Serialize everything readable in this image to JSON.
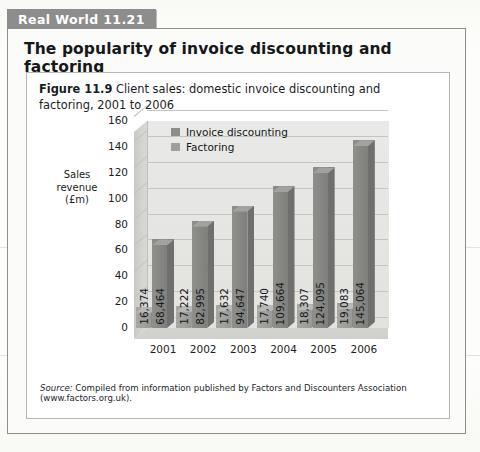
{
  "tab": {
    "label": "Real World 11.21"
  },
  "box": {
    "title": "The popularity of invoice discounting and factoring"
  },
  "figure": {
    "number": "Figure 11.9",
    "caption": "Client sales: domestic invoice discounting and factoring, 2001 to 2006",
    "source_label": "Source:",
    "source_text": "Compiled from information published by Factors and Discounters Association (www.factors.org.uk)."
  },
  "chart_data": {
    "type": "bar",
    "title": "Client sales: domestic invoice discounting and factoring, 2001 to 2006",
    "xlabel": "",
    "ylabel": "Sales revenue (£m)",
    "ylabel_lines": [
      "Sales",
      "revenue",
      "(£m)"
    ],
    "categories": [
      "2001",
      "2002",
      "2003",
      "2004",
      "2005",
      "2006"
    ],
    "ylim": [
      0,
      160
    ],
    "yticks": [
      0,
      20,
      40,
      60,
      80,
      100,
      120,
      140,
      160
    ],
    "grid": true,
    "legend_position": "top-center",
    "series": [
      {
        "name": "Factoring",
        "values": [
          16374,
          17222,
          17632,
          17740,
          18307,
          19083
        ],
        "labels": [
          "16,374",
          "17,222",
          "17,632",
          "17,740",
          "18,307",
          "19,083"
        ],
        "plot_values": [
          16.374,
          17.222,
          17.632,
          17.74,
          18.307,
          19.083
        ],
        "color": "#9e9e9b"
      },
      {
        "name": "Invoice discounting",
        "values": [
          68464,
          82995,
          94647,
          109664,
          124095,
          145064
        ],
        "labels": [
          "68,464",
          "82,995",
          "94,647",
          "109,664",
          "124,095",
          "145,064"
        ],
        "plot_values": [
          68.464,
          82.995,
          94.647,
          109.664,
          124.095,
          145.064
        ],
        "color": "#8d8d8a"
      }
    ],
    "legend": [
      "Invoice discounting",
      "Factoring"
    ]
  }
}
